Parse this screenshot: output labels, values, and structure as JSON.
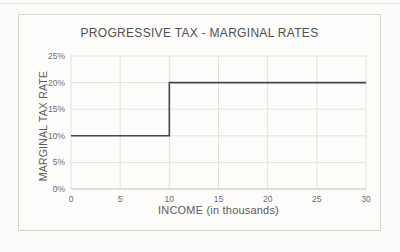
{
  "page": {
    "background": "#fcfcfa"
  },
  "chart_data": {
    "type": "line",
    "subtype": "step",
    "title": "PROGRESSIVE TAX - MARGINAL RATES",
    "xlabel": "INCOME (in thousands)",
    "ylabel": "MARGINAL TAX RATE",
    "xlim": [
      0,
      30
    ],
    "ylim": [
      0,
      25
    ],
    "grid": true,
    "legend": "none",
    "x_ticks": [
      {
        "value": 0,
        "label": "0"
      },
      {
        "value": 5,
        "label": "5"
      },
      {
        "value": 10,
        "label": "10"
      },
      {
        "value": 15,
        "label": "15"
      },
      {
        "value": 20,
        "label": "20"
      },
      {
        "value": 25,
        "label": "25"
      },
      {
        "value": 30,
        "label": "30"
      }
    ],
    "y_ticks": [
      {
        "value": 0,
        "label": "0%"
      },
      {
        "value": 5,
        "label": "5%"
      },
      {
        "value": 10,
        "label": "10%"
      },
      {
        "value": 15,
        "label": "15%"
      },
      {
        "value": 20,
        "label": "20%"
      },
      {
        "value": 25,
        "label": "25%"
      }
    ],
    "series": [
      {
        "name": "Marginal tax rate",
        "points": [
          {
            "x": 0,
            "y": 10
          },
          {
            "x": 10,
            "y": 10
          },
          {
            "x": 10,
            "y": 20
          },
          {
            "x": 30,
            "y": 20
          }
        ]
      }
    ],
    "colors": {
      "line": "#474747",
      "grid": "#e3e1dd",
      "axis": "#c2c0bc",
      "tick_text": "#6b6b6b",
      "title_text": "#4f4f4f",
      "frame_border": "#d8d5d1",
      "frame_fill": "#fefdfb"
    }
  }
}
